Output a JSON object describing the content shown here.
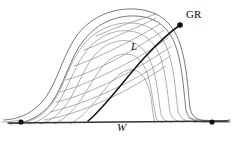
{
  "figure": {
    "width": 234,
    "height": 144,
    "background": "#ffffff",
    "labels": {
      "crest_point": "GR",
      "lee_curve": "L",
      "baseline": "W"
    },
    "colors": {
      "grid_curve": "#8d8d8d",
      "outline_curve": "#6a6a6a",
      "accent_curve": "#1a1a1a",
      "baseline": "#333333",
      "marker": "#111111",
      "background": "#ffffff"
    },
    "stroke_widths": {
      "grid_curve": 0.7,
      "outline_curve": 0.9,
      "accent_curve": 1.6,
      "baseline": 1.4
    },
    "markers": [
      {
        "name": "baseline-left-endpoint",
        "x": 21,
        "y": 122,
        "r": 2.6
      },
      {
        "name": "baseline-right-endpoint",
        "x": 212,
        "y": 122,
        "r": 2.6
      },
      {
        "name": "crest-endpoint",
        "x": 180,
        "y": 25,
        "r": 2.8
      }
    ],
    "baseline_path": "M 8 123 L 228 121",
    "accent_path": "M 88 121 C 104 108 124 80 144 58 C 158 43 170 32 180 25",
    "outline_paths": [
      "M 4 120 C 20 119 34 113 46 97 C 58 80 64 52 78 34 C 92 16 114 8 134 9 C 156 10 172 20 180 44 C 187 64 188 92 190 108 C 192 118 198 121 210 121 C 218 121 224 121 230 120",
      "M 10 124 C 26 123 40 118 52 102 C 64 85 70 57 84 40 C 98 22 118 15 136 16 C 156 17 170 27 177 50 C 183 70 184 96 186 110 C 188 119 194 122 206 122 C 214 122 222 122 230 122"
    ],
    "vertical_curves": [
      "M 18 124 C 32 122 44 116 54 101 C 64 86 70 60 84 44 C 97 29 115 22 132 23 C 150 24 163 34 169 54 C 175 73 176 98 178 111 C 180 119 186 122 196 122",
      "M 28 124 C 42 121 52 114 60 100 C 69 85 76 63 88 49 C 100 35 116 29 130 31 C 146 33 157 44 162 62 C 167 80 168 100 170 112 C 172 119 176 122 184 122",
      "M 40 124 C 52 121 62 112 70 99 C 78 86 84 68 94 56 C 104 44 117 39 129 41 C 142 44 150 56 154 72 C 158 88 159 104 161 114 C 163 120 166 122 172 122",
      "M 54 124 C 64 120 74 110 82 98 C 90 86 96 74 104 65 C 112 56 122 52 132 55 C 142 58 147 70 150 84 C 153 98 154 109 156 117 C 157 121 159 122 163 122",
      "M 70 124 C 80 119 90 108 98 98 C 106 88 112 80 120 74 C 128 68 136 68 142 75 C 148 82 151 94 152 105 C 153 114 154 119 155 122"
    ],
    "horizontal_curves": [
      "M 56 102 C 74 98 94 90 114 80 C 134 70 154 58 172 46",
      "M 50 112 C 68 108 90 100 112 90 C 134 80 154 68 170 56",
      "M 60 92 C 78 87 98 78 118 68 C 136 59 154 48 168 38",
      "M 66 80 C 84 75 104 66 122 56 C 138 47 152 38 164 30",
      "M 74 66 C 90 61 108 52 124 44 C 138 37 150 30 160 24",
      "M 84 50 C 98 45 112 38 126 32 C 138 27 148 22 156 18",
      "M 96 36 C 108 31 120 26 132 22 C 142 19 150 16 156 14",
      "M 44 120 C 62 117 84 110 106 100 C 128 90 148 78 166 66"
    ],
    "tail_curves": [
      "M 2 122 C 8 122 14 121 20 120",
      "M 194 122 C 204 122 214 122 226 122",
      "M 188 118 C 198 120 210 121 230 121"
    ]
  }
}
